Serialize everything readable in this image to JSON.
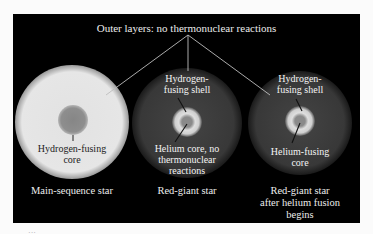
{
  "title": "Outer layers: no thermonuclear reactions",
  "colors": {
    "background": "#000000",
    "main_sequence_envelope": "#e6e6e6",
    "main_sequence_core": "#8c8c8c",
    "red_giant_envelope": "#3a3a3a",
    "shell_bright": "#d8d8d8",
    "core_gray": "#8a8a8a",
    "label_text": "#ececec",
    "connector_lines": "#bdbdbd"
  },
  "stars": [
    {
      "name": "Main-sequence star",
      "inner_label": "Hydrogen-fusing core",
      "inner_label_lines": [
        "Hydrogen-fusing",
        "core"
      ]
    },
    {
      "name": "Red-giant star",
      "shell_label_lines": [
        "Hydrogen-",
        "fusing shell"
      ],
      "core_label_lines": [
        "Helium core, no",
        "thermonuclear",
        "reactions"
      ]
    },
    {
      "name_lines": [
        "Red-giant star",
        "after helium fusion",
        "begins"
      ],
      "shell_label_lines": [
        "Hydrogen-",
        "fusing shell"
      ],
      "core_label_lines": [
        "Helium-fusing",
        "core"
      ]
    }
  ],
  "footer_fragment": "···"
}
